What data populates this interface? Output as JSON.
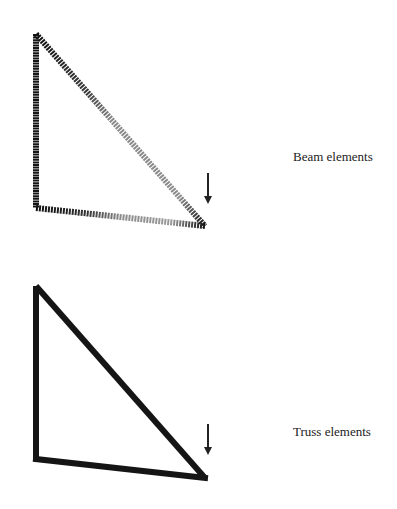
{
  "diagrams": [
    {
      "label": "Beam elements",
      "label_pos": [
        293,
        156
      ],
      "nodes": [
        [
          36,
          34
        ],
        [
          36,
          208
        ],
        [
          205,
          226
        ]
      ],
      "load_arrow": {
        "x": 208,
        "y1": 173,
        "y2": 207
      },
      "style": "gradient-segments",
      "colors": {
        "dark": "#1a1a1a",
        "light": "#8a8a8a"
      }
    },
    {
      "label": "Truss elements",
      "label_pos": [
        293,
        431
      ],
      "nodes": [
        [
          36,
          286
        ],
        [
          36,
          459
        ],
        [
          205,
          478
        ]
      ],
      "load_arrow": {
        "x": 208,
        "y1": 424,
        "y2": 458
      },
      "style": "solid",
      "colors": {
        "dark": "#1a1a1a"
      }
    }
  ]
}
